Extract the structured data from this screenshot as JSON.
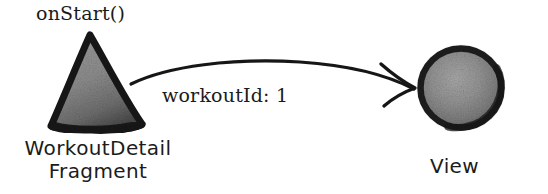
{
  "diagram": {
    "background_color": "#ffffff",
    "ink_color": "#1b1b1b",
    "shape_fill_color": "#8a8a8a",
    "nodes": [
      {
        "id": "fragment",
        "shape": "triangle",
        "caption_line1": "WorkoutDetail",
        "caption_line2": "Fragment",
        "annotation": "onStart()"
      },
      {
        "id": "view",
        "shape": "circle",
        "caption": "View"
      }
    ],
    "edges": [
      {
        "id": "fragment-to-view",
        "from": "fragment",
        "to": "view",
        "label": "workoutId: 1",
        "style": "curved-arrow",
        "arrowhead": "open-chevron"
      }
    ]
  }
}
